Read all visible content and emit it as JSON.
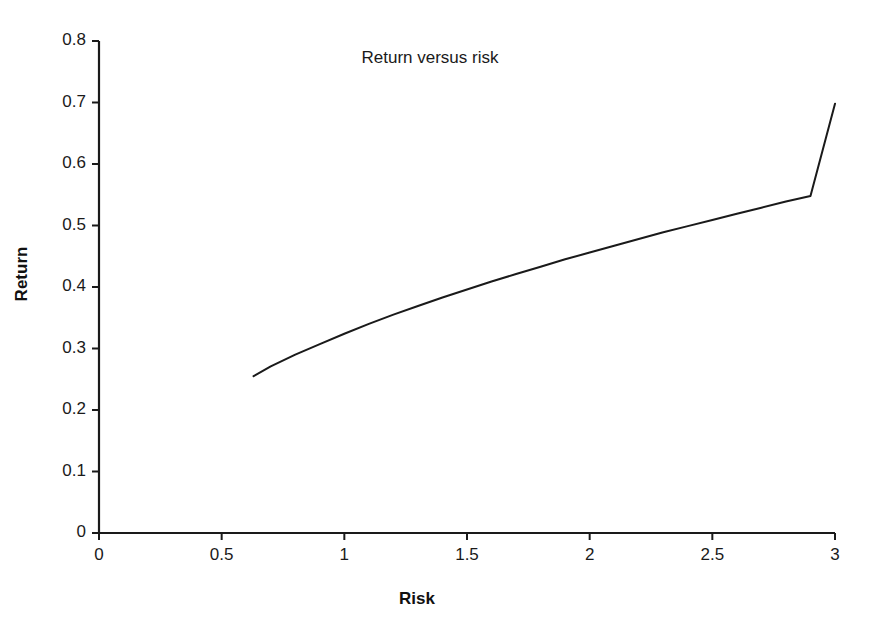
{
  "chart_data": {
    "type": "line",
    "title": "Return versus risk",
    "xlabel": "Risk",
    "ylabel": "Return",
    "xlim": [
      0,
      3
    ],
    "ylim": [
      0,
      0.8
    ],
    "grid": false,
    "legend": null,
    "line_color": "#1a1a1a",
    "background_color": "#ffffff",
    "xticks": [
      0,
      0.5,
      1,
      1.5,
      2,
      2.5,
      3
    ],
    "xtick_labels": [
      "0",
      "0.5",
      "1",
      "1.5",
      "2",
      "2.5",
      "3"
    ],
    "yticks": [
      0,
      0.1,
      0.2,
      0.3,
      0.4,
      0.5,
      0.6,
      0.7,
      0.8
    ],
    "ytick_labels": [
      "0",
      "0.1",
      "0.2",
      "0.3",
      "0.4",
      "0.5",
      "0.6",
      "0.7",
      "0.8"
    ],
    "series": [
      {
        "name": "Return versus risk",
        "x": [
          0.63,
          0.7,
          0.8,
          0.9,
          1.0,
          1.1,
          1.2,
          1.3,
          1.4,
          1.5,
          1.6,
          1.7,
          1.8,
          1.9,
          2.0,
          2.1,
          2.2,
          2.3,
          2.4,
          2.5,
          2.6,
          2.7,
          2.8,
          2.9,
          3.0
        ],
        "y": [
          0.255,
          0.271,
          0.29,
          0.307,
          0.324,
          0.34,
          0.355,
          0.369,
          0.383,
          0.396,
          0.409,
          0.421,
          0.433,
          0.445,
          0.456,
          0.467,
          0.478,
          0.489,
          0.499,
          0.509,
          0.519,
          0.529,
          0.539,
          0.548,
          0.698
        ]
      }
    ]
  },
  "axes": {
    "x_tick_labels": [
      "0",
      "0.5",
      "1",
      "1.5",
      "2",
      "2.5",
      "3"
    ],
    "y_tick_labels": [
      "0.8",
      "0.7",
      "0.6",
      "0.5",
      "0.4",
      "0.3",
      "0.2",
      "0.1",
      "0"
    ]
  },
  "labels": {
    "title": "Return versus risk",
    "x_axis": "Risk",
    "y_axis": "Return"
  }
}
